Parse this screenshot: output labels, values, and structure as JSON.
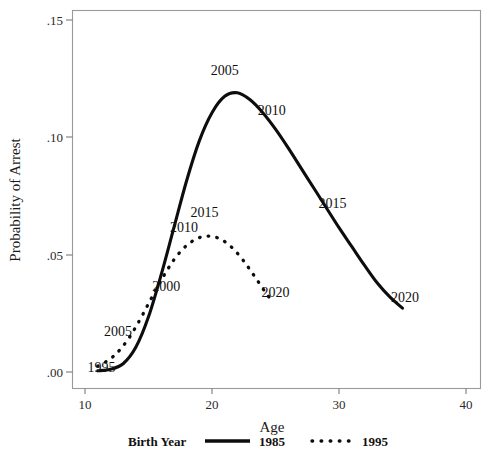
{
  "chart_data": {
    "type": "line",
    "title": "",
    "xlabel": "Age",
    "ylabel": "Probability of Arrest",
    "xlim": [
      10,
      40
    ],
    "ylim": [
      0.0,
      0.15
    ],
    "xticks": [
      "10",
      "20",
      "30",
      "40"
    ],
    "xtick_values": [
      10,
      20,
      30,
      40
    ],
    "yticks": [
      ".00",
      ".05",
      ".10",
      ".15"
    ],
    "ytick_values": [
      0.0,
      0.05,
      0.1,
      0.15
    ],
    "grid": false,
    "legend_position": "bottom",
    "legend_title": "Birth Year",
    "series": [
      {
        "name": "1985",
        "style": "solid",
        "x": [
          11.0,
          12.0,
          13.0,
          14.0,
          15.0,
          16.0,
          17.0,
          18.0,
          19.0,
          20.0,
          21.0,
          22.0,
          23.0,
          24.0,
          25.0,
          26.0,
          27.0,
          28.0,
          29.0,
          30.0,
          31.0,
          32.0,
          33.0,
          34.0,
          35.0
        ],
        "y": [
          0.0005,
          0.0012,
          0.0035,
          0.0105,
          0.0235,
          0.0415,
          0.0615,
          0.0815,
          0.0985,
          0.1105,
          0.1175,
          0.119,
          0.116,
          0.1105,
          0.1035,
          0.0955,
          0.087,
          0.0785,
          0.07,
          0.0615,
          0.0535,
          0.0455,
          0.038,
          0.032,
          0.0272
        ],
        "annotations": [
          {
            "label": "1995",
            "x": 11.3,
            "y": 0.0
          },
          {
            "label": "2000",
            "x": 16.4,
            "y": 0.0345
          },
          {
            "label": "2010",
            "x": 17.8,
            "y": 0.0595
          },
          {
            "label": "2005",
            "x": 21.0,
            "y": 0.1265
          },
          {
            "label": "2010",
            "x": 24.7,
            "y": 0.1095
          },
          {
            "label": "2015",
            "x": 29.5,
            "y": 0.07
          },
          {
            "label": "2020",
            "x": 35.2,
            "y": 0.03
          }
        ]
      },
      {
        "name": "1995",
        "style": "dotted",
        "x": [
          11.0,
          11.6,
          12.2,
          12.8,
          13.4,
          14.0,
          14.6,
          15.2,
          15.8,
          16.4,
          17.0,
          17.6,
          18.2,
          18.8,
          19.4,
          20.0,
          20.6,
          21.2,
          21.8,
          22.4,
          23.0,
          23.6,
          24.2,
          24.6
        ],
        "y": [
          0.0025,
          0.0042,
          0.0065,
          0.0098,
          0.014,
          0.0192,
          0.025,
          0.0312,
          0.0372,
          0.0428,
          0.0478,
          0.0518,
          0.0548,
          0.0568,
          0.0578,
          0.0578,
          0.0568,
          0.0548,
          0.0518,
          0.048,
          0.0435,
          0.0388,
          0.034,
          0.0312
        ],
        "annotations": [
          {
            "label": "2005",
            "x": 12.6,
            "y": 0.0155
          },
          {
            "label": "2015",
            "x": 19.4,
            "y": 0.066
          },
          {
            "label": "2020",
            "x": 25.0,
            "y": 0.032
          }
        ]
      }
    ]
  },
  "axes": {
    "y_title": "Probability of Arrest",
    "x_title": "Age",
    "x_tick_labels": [
      "10",
      "20",
      "30",
      "40"
    ],
    "y_tick_labels": [
      ".15",
      ".10",
      ".05",
      ".00"
    ]
  },
  "annotations": {
    "solid": [
      "1995",
      "2000",
      "2010",
      "2005",
      "2010",
      "2015",
      "2020"
    ],
    "dotted": [
      "2005",
      "2015",
      "2020"
    ]
  },
  "legend": {
    "title": "Birth Year",
    "entries": [
      {
        "label": "1985",
        "style": "solid"
      },
      {
        "label": "1995",
        "style": "dotted"
      }
    ]
  },
  "colors": {
    "line": "#0d0d0d",
    "frame": "#9a9a9a",
    "text": "#1a1a1a",
    "background": "#ffffff"
  }
}
